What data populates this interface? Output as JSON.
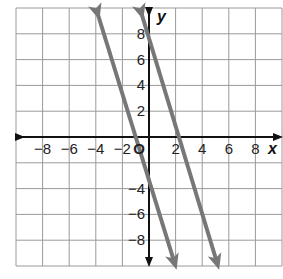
{
  "chart_data": {
    "type": "line",
    "title": "",
    "xlabel": "x",
    "ylabel": "y",
    "origin_label": "O",
    "xlim": [
      -10,
      10
    ],
    "ylim": [
      -10,
      10
    ],
    "grid": true,
    "grid_step": 2,
    "x_ticks": [
      "−8",
      "−6",
      "−4",
      "−2",
      "2",
      "4",
      "6",
      "8"
    ],
    "y_ticks": [
      "8",
      "6",
      "4",
      "2",
      "−4",
      "−6",
      "−8"
    ],
    "series": [
      {
        "name": "line-1",
        "slope": -3.5,
        "intercept": -3.5,
        "x_intercept": -1,
        "y_intercept": -3.5,
        "points": [
          [
            -3.9,
            10
          ],
          [
            1.9,
            -10
          ]
        ],
        "color": "#777777"
      },
      {
        "name": "line-2",
        "slope": -3.5,
        "intercept": 8,
        "x_intercept": 2.3,
        "y_intercept": 8,
        "points": [
          [
            -0.6,
            10
          ],
          [
            5.1,
            -10
          ]
        ],
        "color": "#777777"
      }
    ],
    "legend": null
  }
}
